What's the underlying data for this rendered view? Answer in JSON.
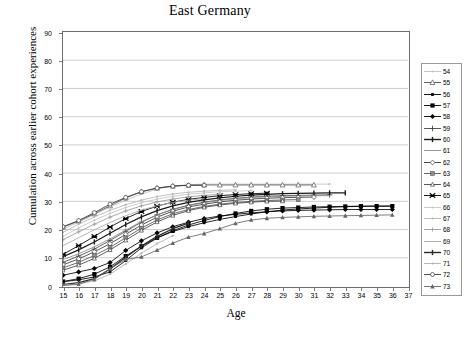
{
  "chart": {
    "title": "East Germany",
    "xlabel": "Age",
    "ylabel": "Cumulation across earlier cohort experiences"
  },
  "chart_data": {
    "type": "line",
    "title": "East Germany",
    "subtitle": "",
    "xlabel": "Age",
    "ylabel": "Cumulation across earlier cohort experiences",
    "xlim": [
      15,
      37
    ],
    "ylim": [
      0,
      90
    ],
    "xticks": [
      15,
      16,
      17,
      18,
      19,
      20,
      21,
      22,
      23,
      24,
      25,
      26,
      27,
      28,
      29,
      30,
      31,
      32,
      33,
      34,
      35,
      36,
      37
    ],
    "yticks": [
      0,
      10,
      20,
      30,
      40,
      50,
      60,
      70,
      80,
      90
    ],
    "grid": "horizontal",
    "legend_position": "right",
    "legend_title": "",
    "x": [
      15,
      16,
      17,
      18,
      19,
      20,
      21,
      22,
      23,
      24,
      25,
      26,
      27,
      28,
      29,
      30,
      31,
      32,
      33,
      34,
      35,
      36
    ],
    "series": [
      {
        "name": "54",
        "color": "#bfbfbf",
        "marker": "dot-small",
        "values": [
          20.2,
          22.6,
          25.3,
          28.0,
          30.4,
          32.6,
          34.3,
          35.4,
          35.9,
          36.1,
          36.1,
          36.1,
          36.1,
          36.1,
          36.1,
          36.1,
          36.1,
          36.1,
          null,
          null,
          null,
          null
        ]
      },
      {
        "name": "55",
        "color": "#555555",
        "marker": "triangle-open",
        "values": [
          20.9,
          23.0,
          25.6,
          28.4,
          31.2,
          33.4,
          34.7,
          35.4,
          35.7,
          35.8,
          35.8,
          35.8,
          35.8,
          35.8,
          35.8,
          35.8,
          35.8,
          null,
          null,
          null,
          null,
          null
        ]
      },
      {
        "name": "56",
        "color": "#000000",
        "marker": "square-small",
        "values": [
          1.5,
          2.2,
          3.2,
          5.0,
          9.0,
          13.5,
          17.0,
          19.3,
          21.0,
          22.4,
          23.6,
          24.6,
          25.5,
          26.3,
          26.9,
          27.3,
          27.6,
          27.9,
          28.1,
          28.2,
          28.3,
          28.3
        ]
      },
      {
        "name": "57",
        "color": "#000000",
        "marker": "square-filled",
        "values": [
          1.6,
          2.6,
          4.2,
          6.8,
          10.6,
          14.1,
          17.1,
          19.6,
          21.6,
          23.2,
          24.6,
          25.7,
          26.6,
          27.2,
          27.6,
          27.8,
          28.0,
          28.1,
          28.2,
          28.3,
          28.3,
          28.3
        ]
      },
      {
        "name": "58",
        "color": "#000000",
        "marker": "diamond-filled",
        "values": [
          3.8,
          5.0,
          6.2,
          8.3,
          12.6,
          16.0,
          18.8,
          21.0,
          22.6,
          23.9,
          24.8,
          25.4,
          25.9,
          26.3,
          26.6,
          26.8,
          26.9,
          27.0,
          27.1,
          27.1,
          27.1,
          27.1
        ]
      },
      {
        "name": "59",
        "color": "#4a4a4a",
        "marker": "plus",
        "values": [
          8.4,
          10.6,
          13.1,
          16.1,
          19.4,
          22.6,
          25.2,
          27.2,
          28.6,
          29.7,
          30.5,
          31.1,
          31.5,
          31.8,
          32.0,
          32.1,
          32.2,
          32.3,
          null,
          null,
          null,
          null
        ]
      },
      {
        "name": "60",
        "color": "#1a1a1a",
        "marker": "line-thick",
        "values": [
          10.4,
          12.8,
          15.6,
          18.7,
          21.8,
          24.5,
          26.7,
          28.4,
          29.6,
          30.5,
          31.2,
          31.8,
          32.2,
          32.5,
          32.7,
          32.8,
          32.9,
          33.0,
          33.0,
          null,
          null,
          null
        ]
      },
      {
        "name": "61",
        "color": "#8a8a8a",
        "marker": "none",
        "values": [
          9.4,
          11.4,
          13.9,
          16.7,
          19.8,
          22.8,
          25.2,
          27.1,
          28.5,
          29.5,
          30.3,
          30.9,
          31.3,
          31.6,
          31.8,
          31.9,
          32.0,
          32.0,
          null,
          null,
          null,
          null
        ]
      },
      {
        "name": "62",
        "color": "#3a3a3a",
        "marker": "diamond-open",
        "values": [
          7.5,
          9.6,
          12.1,
          15.0,
          18.3,
          21.6,
          24.4,
          26.5,
          28.0,
          29.0,
          29.8,
          30.4,
          30.8,
          31.1,
          31.3,
          31.4,
          31.5,
          null,
          null,
          null,
          null,
          null
        ]
      },
      {
        "name": "63",
        "color": "#555555",
        "marker": "square-half",
        "values": [
          6.4,
          8.4,
          10.8,
          13.7,
          17.1,
          20.5,
          23.4,
          25.6,
          27.1,
          28.2,
          29.0,
          29.6,
          30.0,
          30.3,
          30.5,
          30.6,
          null,
          null,
          null,
          null,
          null,
          null
        ]
      },
      {
        "name": "64",
        "color": "#444444",
        "marker": "triangle-small",
        "values": [
          5.6,
          7.4,
          9.8,
          12.8,
          16.2,
          19.7,
          22.7,
          25.0,
          26.7,
          27.9,
          28.7,
          29.3,
          29.7,
          30.0,
          30.1,
          null,
          null,
          null,
          null,
          null,
          null,
          null
        ]
      },
      {
        "name": "65",
        "color": "#000000",
        "marker": "bowtie",
        "values": [
          11.2,
          14.3,
          17.6,
          20.9,
          23.9,
          26.4,
          28.3,
          29.7,
          30.7,
          31.4,
          32.0,
          32.4,
          32.7,
          32.9,
          null,
          null,
          null,
          null,
          null,
          null,
          null,
          null
        ]
      },
      {
        "name": "66",
        "color": "#c4c4c4",
        "marker": "dot-small",
        "values": [
          17.6,
          20.6,
          23.3,
          25.7,
          27.8,
          29.5,
          30.8,
          31.8,
          32.5,
          33.0,
          33.4,
          33.6,
          33.8,
          null,
          null,
          null,
          null,
          null,
          null,
          null,
          null,
          null
        ]
      },
      {
        "name": "67",
        "color": "#b5b5b5",
        "marker": "dot-small",
        "values": [
          19.0,
          21.9,
          24.5,
          26.8,
          28.8,
          30.4,
          31.7,
          32.6,
          33.2,
          33.6,
          33.9,
          34.1,
          null,
          null,
          null,
          null,
          null,
          null,
          null,
          null,
          null,
          null
        ]
      },
      {
        "name": "68",
        "color": "#9a9a9a",
        "marker": "plus-small",
        "values": [
          16.4,
          19.2,
          21.9,
          24.4,
          26.6,
          28.4,
          29.8,
          30.8,
          31.6,
          32.1,
          32.5,
          null,
          null,
          null,
          null,
          null,
          null,
          null,
          null,
          null,
          null,
          null
        ]
      },
      {
        "name": "69",
        "color": "#a8a8a8",
        "marker": "none",
        "values": [
          14.3,
          17.1,
          19.9,
          22.5,
          24.9,
          26.9,
          28.4,
          29.6,
          30.4,
          31.0,
          null,
          null,
          null,
          null,
          null,
          null,
          null,
          null,
          null,
          null,
          null,
          null
        ]
      },
      {
        "name": "70",
        "color": "#2a2a2a",
        "marker": "line-thick",
        "values": [
          0.5,
          1.2,
          2.6,
          6.0,
          10.2,
          14.2,
          17.6,
          20.3,
          22.3,
          null,
          null,
          null,
          null,
          null,
          null,
          null,
          null,
          null,
          null,
          null,
          null,
          null
        ]
      },
      {
        "name": "71",
        "color": "#b0b0b0",
        "marker": "dot-small",
        "values": [
          0.3,
          0.8,
          1.8,
          4.2,
          7.8,
          11.6,
          15.0,
          17.8,
          null,
          null,
          null,
          null,
          null,
          null,
          null,
          null,
          null,
          null,
          null,
          null,
          null,
          null
        ]
      },
      {
        "name": "72",
        "color": "#3a3a3a",
        "marker": "circle-open",
        "values": [
          21.0,
          23.2,
          26.0,
          29.0,
          31.4,
          33.4,
          34.7,
          35.4,
          35.7,
          35.7,
          null,
          null,
          null,
          null,
          null,
          null,
          null,
          null,
          null,
          null,
          null,
          null
        ]
      },
      {
        "name": "73",
        "color": "#666666",
        "marker": "triangle-filled",
        "values": [
          0.2,
          0.6,
          2.4,
          6.2,
          9.4,
          10.3,
          12.7,
          15.2,
          17.3,
          18.6,
          20.3,
          22.2,
          23.4,
          24.0,
          24.3,
          24.5,
          24.7,
          24.8,
          24.9,
          25.0,
          25.1,
          25.2
        ]
      }
    ]
  },
  "legend": {
    "items": [
      {
        "label": "54"
      },
      {
        "label": "55"
      },
      {
        "label": "56"
      },
      {
        "label": "57"
      },
      {
        "label": "58"
      },
      {
        "label": "59"
      },
      {
        "label": "60"
      },
      {
        "label": "61"
      },
      {
        "label": "62"
      },
      {
        "label": "63"
      },
      {
        "label": "64"
      },
      {
        "label": "65"
      },
      {
        "label": "66"
      },
      {
        "label": "67"
      },
      {
        "label": "68"
      },
      {
        "label": "69"
      },
      {
        "label": "70"
      },
      {
        "label": "71"
      },
      {
        "label": "72"
      },
      {
        "label": "73"
      }
    ]
  }
}
